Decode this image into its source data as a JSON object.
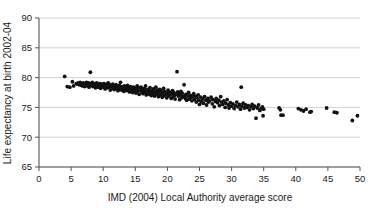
{
  "chart_data": {
    "type": "scatter",
    "title": "",
    "xlabel": "IMD (2004) Local Authority average score",
    "ylabel": "Life expectancy at birth 2002-04",
    "xlim": [
      0,
      50
    ],
    "ylim": [
      65,
      90
    ],
    "xticks": [
      0,
      5,
      10,
      15,
      20,
      25,
      30,
      35,
      40,
      45,
      50
    ],
    "yticks": [
      65,
      70,
      75,
      80,
      85,
      90
    ],
    "xtick_labels": [
      "0",
      "5",
      "10",
      "15",
      "20",
      "25",
      "30",
      "35",
      "40",
      "45",
      "50"
    ],
    "ytick_labels": [
      "65",
      "70",
      "75",
      "80",
      "85",
      "90"
    ],
    "grid": "horizontal",
    "legend": "none",
    "marker_color": "#111111",
    "marker_size": 1.9,
    "points": [
      [
        4.0,
        80.2
      ],
      [
        4.4,
        78.5
      ],
      [
        4.8,
        78.4
      ],
      [
        5.2,
        79.3
      ],
      [
        5.4,
        78.6
      ],
      [
        5.8,
        79.0
      ],
      [
        6.0,
        78.9
      ],
      [
        6.1,
        79.1
      ],
      [
        6.3,
        78.8
      ],
      [
        6.4,
        79.2
      ],
      [
        6.6,
        78.7
      ],
      [
        6.7,
        79.0
      ],
      [
        6.8,
        78.6
      ],
      [
        6.9,
        79.1
      ],
      [
        7.0,
        78.9
      ],
      [
        7.1,
        78.5
      ],
      [
        7.2,
        79.0
      ],
      [
        7.3,
        78.8
      ],
      [
        7.4,
        79.2
      ],
      [
        7.5,
        78.6
      ],
      [
        7.6,
        78.9
      ],
      [
        7.7,
        79.1
      ],
      [
        7.8,
        78.4
      ],
      [
        7.9,
        78.8
      ],
      [
        8.0,
        79.0
      ],
      [
        8.0,
        80.9
      ],
      [
        8.2,
        78.7
      ],
      [
        8.3,
        79.2
      ],
      [
        8.4,
        78.5
      ],
      [
        8.5,
        78.9
      ],
      [
        8.6,
        79.0
      ],
      [
        8.7,
        78.6
      ],
      [
        8.8,
        78.3
      ],
      [
        8.9,
        78.8
      ],
      [
        9.0,
        79.1
      ],
      [
        9.1,
        78.7
      ],
      [
        9.2,
        78.4
      ],
      [
        9.3,
        78.9
      ],
      [
        9.4,
        78.6
      ],
      [
        9.5,
        79.0
      ],
      [
        9.6,
        78.2
      ],
      [
        9.7,
        78.7
      ],
      [
        9.8,
        78.9
      ],
      [
        9.9,
        78.4
      ],
      [
        10.0,
        78.8
      ],
      [
        10.1,
        79.0
      ],
      [
        10.2,
        78.5
      ],
      [
        10.3,
        78.1
      ],
      [
        10.4,
        78.7
      ],
      [
        10.5,
        78.9
      ],
      [
        10.6,
        78.3
      ],
      [
        10.7,
        78.6
      ],
      [
        10.8,
        79.1
      ],
      [
        10.9,
        78.4
      ],
      [
        11.0,
        78.8
      ],
      [
        11.1,
        77.9
      ],
      [
        11.2,
        78.5
      ],
      [
        11.3,
        78.7
      ],
      [
        11.4,
        78.2
      ],
      [
        11.5,
        78.9
      ],
      [
        11.6,
        78.4
      ],
      [
        11.7,
        78.0
      ],
      [
        11.8,
        78.6
      ],
      [
        11.9,
        78.3
      ],
      [
        12.0,
        78.8
      ],
      [
        12.1,
        78.1
      ],
      [
        12.2,
        78.5
      ],
      [
        12.3,
        77.8
      ],
      [
        12.4,
        78.4
      ],
      [
        12.5,
        78.7
      ],
      [
        12.6,
        78.0
      ],
      [
        12.7,
        79.2
      ],
      [
        12.8,
        78.3
      ],
      [
        12.9,
        77.9
      ],
      [
        13.0,
        78.5
      ],
      [
        13.1,
        78.2
      ],
      [
        13.2,
        77.7
      ],
      [
        13.3,
        78.6
      ],
      [
        13.4,
        78.1
      ],
      [
        13.5,
        78.4
      ],
      [
        13.6,
        77.8
      ],
      [
        13.7,
        78.3
      ],
      [
        13.8,
        78.7
      ],
      [
        13.9,
        78.0
      ],
      [
        14.0,
        78.4
      ],
      [
        14.1,
        77.6
      ],
      [
        14.2,
        78.2
      ],
      [
        14.3,
        78.5
      ],
      [
        14.4,
        77.9
      ],
      [
        14.5,
        78.3
      ],
      [
        14.6,
        77.5
      ],
      [
        14.7,
        78.0
      ],
      [
        14.8,
        78.4
      ],
      [
        14.9,
        77.8
      ],
      [
        15.0,
        78.2
      ],
      [
        15.1,
        77.4
      ],
      [
        15.2,
        78.1
      ],
      [
        15.3,
        78.6
      ],
      [
        15.4,
        77.7
      ],
      [
        15.5,
        78.3
      ],
      [
        15.6,
        77.2
      ],
      [
        15.8,
        77.9
      ],
      [
        15.9,
        78.4
      ],
      [
        16.0,
        77.6
      ],
      [
        16.1,
        78.0
      ],
      [
        16.2,
        77.3
      ],
      [
        16.3,
        77.8
      ],
      [
        16.4,
        78.2
      ],
      [
        16.5,
        77.5
      ],
      [
        16.6,
        78.6
      ],
      [
        16.7,
        77.1
      ],
      [
        16.8,
        77.9
      ],
      [
        16.9,
        77.4
      ],
      [
        17.0,
        78.0
      ],
      [
        17.1,
        77.7
      ],
      [
        17.2,
        77.2
      ],
      [
        17.3,
        78.3
      ],
      [
        17.4,
        77.6
      ],
      [
        17.5,
        77.0
      ],
      [
        17.6,
        77.8
      ],
      [
        17.7,
        77.3
      ],
      [
        17.8,
        78.1
      ],
      [
        17.9,
        77.5
      ],
      [
        18.0,
        76.9
      ],
      [
        18.1,
        77.7
      ],
      [
        18.2,
        78.4
      ],
      [
        18.3,
        77.2
      ],
      [
        18.4,
        77.9
      ],
      [
        18.5,
        77.4
      ],
      [
        18.6,
        76.8
      ],
      [
        18.7,
        77.6
      ],
      [
        18.8,
        78.0
      ],
      [
        18.9,
        77.1
      ],
      [
        19.0,
        77.8
      ],
      [
        19.1,
        77.3
      ],
      [
        19.2,
        76.7
      ],
      [
        19.3,
        77.5
      ],
      [
        19.4,
        78.2
      ],
      [
        19.5,
        77.0
      ],
      [
        19.6,
        77.7
      ],
      [
        19.8,
        77.2
      ],
      [
        19.9,
        76.6
      ],
      [
        20.0,
        77.4
      ],
      [
        20.1,
        77.9
      ],
      [
        20.2,
        76.9
      ],
      [
        20.3,
        77.6
      ],
      [
        20.4,
        77.1
      ],
      [
        20.6,
        76.5
      ],
      [
        20.7,
        77.3
      ],
      [
        20.8,
        77.8
      ],
      [
        20.9,
        76.8
      ],
      [
        21.0,
        77.5
      ],
      [
        21.1,
        77.0
      ],
      [
        21.2,
        76.4
      ],
      [
        21.3,
        77.2
      ],
      [
        21.5,
        81.0
      ],
      [
        21.6,
        77.6
      ],
      [
        21.7,
        76.9
      ],
      [
        21.8,
        77.3
      ],
      [
        21.9,
        76.3
      ],
      [
        22.0,
        77.1
      ],
      [
        22.1,
        77.7
      ],
      [
        22.2,
        76.6
      ],
      [
        22.3,
        77.4
      ],
      [
        22.4,
        76.8
      ],
      [
        22.6,
        78.8
      ],
      [
        22.7,
        77.0
      ],
      [
        22.8,
        76.5
      ],
      [
        22.9,
        77.2
      ],
      [
        23.0,
        76.2
      ],
      [
        23.2,
        76.9
      ],
      [
        23.3,
        77.5
      ],
      [
        23.4,
        76.4
      ],
      [
        23.6,
        77.0
      ],
      [
        23.7,
        76.7
      ],
      [
        23.8,
        76.1
      ],
      [
        24.0,
        76.8
      ],
      [
        24.1,
        77.3
      ],
      [
        24.2,
        76.3
      ],
      [
        24.4,
        76.9
      ],
      [
        24.5,
        75.9
      ],
      [
        24.6,
        76.6
      ],
      [
        24.8,
        77.1
      ],
      [
        24.9,
        76.2
      ],
      [
        25.0,
        75.5
      ],
      [
        25.2,
        76.7
      ],
      [
        25.3,
        76.0
      ],
      [
        25.5,
        76.4
      ],
      [
        25.6,
        75.7
      ],
      [
        25.8,
        76.8
      ],
      [
        26.0,
        76.2
      ],
      [
        26.1,
        75.4
      ],
      [
        26.3,
        76.5
      ],
      [
        26.4,
        75.9
      ],
      [
        26.6,
        76.1
      ],
      [
        26.8,
        76.7
      ],
      [
        27.0,
        75.6
      ],
      [
        27.1,
        76.3
      ],
      [
        27.3,
        75.1
      ],
      [
        27.5,
        76.0
      ],
      [
        27.6,
        76.5
      ],
      [
        27.8,
        75.8
      ],
      [
        28.0,
        76.2
      ],
      [
        28.1,
        75.3
      ],
      [
        28.3,
        76.8
      ],
      [
        28.4,
        75.9
      ],
      [
        28.6,
        75.5
      ],
      [
        28.8,
        76.1
      ],
      [
        29.0,
        75.0
      ],
      [
        29.1,
        75.7
      ],
      [
        29.3,
        76.3
      ],
      [
        29.5,
        75.4
      ],
      [
        29.6,
        74.9
      ],
      [
        29.8,
        75.8
      ],
      [
        30.0,
        75.2
      ],
      [
        30.2,
        75.6
      ],
      [
        30.4,
        74.8
      ],
      [
        30.6,
        75.3
      ],
      [
        30.8,
        75.9
      ],
      [
        31.0,
        75.1
      ],
      [
        31.2,
        75.5
      ],
      [
        31.4,
        74.7
      ],
      [
        31.5,
        78.4
      ],
      [
        31.6,
        75.2
      ],
      [
        31.8,
        75.7
      ],
      [
        32.0,
        74.9
      ],
      [
        32.2,
        75.4
      ],
      [
        32.4,
        75.0
      ],
      [
        32.6,
        75.3
      ],
      [
        32.8,
        74.6
      ],
      [
        33.0,
        75.1
      ],
      [
        33.2,
        75.5
      ],
      [
        33.4,
        74.8
      ],
      [
        33.6,
        75.2
      ],
      [
        33.8,
        73.2
      ],
      [
        34.0,
        74.9
      ],
      [
        34.2,
        75.4
      ],
      [
        34.4,
        74.5
      ],
      [
        34.6,
        74.8
      ],
      [
        34.8,
        75.1
      ],
      [
        34.9,
        73.6
      ],
      [
        35.0,
        74.7
      ],
      [
        37.4,
        74.9
      ],
      [
        37.6,
        74.6
      ],
      [
        37.7,
        73.7
      ],
      [
        38.0,
        73.7
      ],
      [
        40.4,
        74.8
      ],
      [
        40.8,
        74.6
      ],
      [
        41.2,
        74.4
      ],
      [
        41.6,
        74.7
      ],
      [
        42.2,
        74.2
      ],
      [
        42.4,
        74.3
      ],
      [
        44.8,
        74.9
      ],
      [
        46.0,
        74.2
      ],
      [
        46.4,
        74.1
      ],
      [
        48.8,
        72.8
      ],
      [
        49.6,
        73.6
      ]
    ]
  }
}
